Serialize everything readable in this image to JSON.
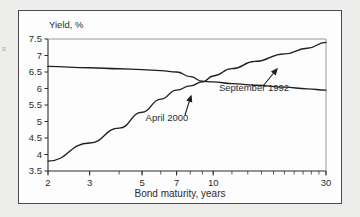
{
  "figure": {
    "y_axis_title": "Yield, %",
    "x_axis_title": "Bond maturity, years",
    "edge_glyph": "s"
  },
  "chart_data": {
    "type": "line",
    "title": "",
    "xlabel": "Bond maturity, years",
    "ylabel": "Yield, %",
    "x_scale": "log",
    "xlim": [
      2,
      30
    ],
    "ylim": [
      3.5,
      7.5
    ],
    "ytick_labels": [
      "7.5",
      "7",
      "6.5",
      "6",
      "5.5",
      "5",
      "4.5",
      "4",
      "3.5"
    ],
    "ytick_values": [
      7.5,
      7,
      6.5,
      6,
      5.5,
      5,
      4.5,
      4,
      3.5
    ],
    "xtick_labels": [
      "2",
      "3",
      "5",
      "7",
      "10",
      "30"
    ],
    "xtick_values": [
      2,
      3,
      5,
      7,
      10,
      30
    ],
    "x_minor_ticks": [
      2,
      3,
      4,
      5,
      6,
      7,
      8,
      9,
      10,
      12,
      14,
      16,
      18,
      20,
      22,
      24,
      26,
      28,
      30
    ],
    "grid": false,
    "legend_position": "inline-annotations",
    "series": [
      {
        "name": "September 1992",
        "x": [
          2,
          3,
          4,
          5,
          6,
          7,
          8,
          9,
          10,
          12,
          15,
          20,
          25,
          30
        ],
        "values": [
          3.8,
          4.35,
          4.8,
          5.28,
          5.68,
          5.95,
          6.08,
          6.2,
          6.38,
          6.6,
          6.82,
          7.05,
          7.22,
          7.4
        ]
      },
      {
        "name": "April 2000",
        "x": [
          2,
          3,
          4,
          5,
          6,
          7,
          8,
          9,
          10,
          12,
          15,
          20,
          25,
          30
        ],
        "values": [
          6.67,
          6.63,
          6.6,
          6.57,
          6.54,
          6.5,
          6.36,
          6.22,
          6.2,
          6.15,
          6.1,
          6.04,
          5.99,
          5.95
        ]
      }
    ],
    "annotations": [
      {
        "label": "September 1992",
        "label_x": 235,
        "label_y": 80,
        "arrow_from_x": 244,
        "arrow_from_y": 75,
        "arrow_to_x": 258,
        "arrow_to_y": 58
      },
      {
        "label": "April 2000",
        "label_x": 148,
        "label_y": 110,
        "arrow_from_x": 166,
        "arrow_from_y": 104,
        "arrow_to_x": 172,
        "arrow_to_y": 85
      }
    ]
  }
}
